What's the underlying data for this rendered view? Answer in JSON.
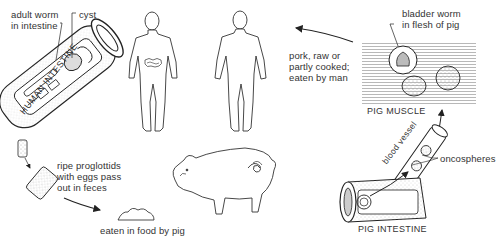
{
  "diagram": {
    "labels": {
      "adult_worm": "adult worm\nin intestine",
      "cyst": "cyst",
      "human_intestine": "HUMAN INTESTINE",
      "pork_eaten": "pork, raw or\npartly cooked;\neaten by man",
      "bladder_worm": "bladder worm\nin flesh of pig",
      "pig_muscle": "PIG MUSCLE",
      "blood_vessel": "blood vessel",
      "oncospheres": "oncospheres",
      "pig_intestine": "PIG INTESTINE",
      "proglottids": "ripe proglottids\nwith eggs pass\nout in feces",
      "eaten_by_pig": "eaten in food by pig"
    },
    "stages": [
      {
        "id": "human-intestine",
        "caption": "HUMAN INTESTINE"
      },
      {
        "id": "proglottids",
        "caption": "ripe proglottids with eggs pass out in feces"
      },
      {
        "id": "pig-food",
        "caption": "eaten in food by pig"
      },
      {
        "id": "pig-intestine",
        "caption": "PIG INTESTINE"
      },
      {
        "id": "pig-muscle",
        "caption": "PIG MUSCLE"
      },
      {
        "id": "human-host",
        "caption": "pork, raw or partly cooked; eaten by man"
      }
    ],
    "colors": {
      "ink": "#2a2a2a",
      "stipple": "#9a9a9a",
      "background": "#ffffff"
    }
  }
}
